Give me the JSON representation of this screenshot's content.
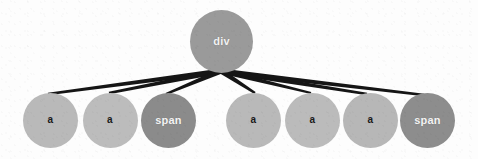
{
  "diagram": {
    "type": "tree",
    "background_color": "#fdfdfd",
    "edge_color": "#151515",
    "root": {
      "id": "root-div",
      "label": "div",
      "tag": "div",
      "cx": 221.5,
      "cy": 41,
      "r": 31.5,
      "fill": "#9a9a9a",
      "text_color": "#f2f2f2",
      "font_size": 11
    },
    "edge_origin": {
      "x": 221,
      "y": 71
    },
    "children": [
      {
        "id": "child-1",
        "label": "a",
        "tag": "a",
        "group": "left",
        "cx": 50.5,
        "cy": 120,
        "r": 27.5,
        "fill": "#b9b9b9",
        "text_color": "#1a1a1a",
        "endpoint": {
          "x": 48,
          "y": 94
        }
      },
      {
        "id": "child-2",
        "label": "a",
        "tag": "a",
        "group": "left",
        "cx": 110,
        "cy": 120,
        "r": 27.5,
        "fill": "#bcbcbc",
        "text_color": "#1a1a1a",
        "endpoint": {
          "x": 109,
          "y": 93
        }
      },
      {
        "id": "child-3",
        "label": "span",
        "tag": "span",
        "group": "left",
        "cx": 168.5,
        "cy": 120,
        "r": 27.5,
        "fill": "#8b8b8b",
        "text_color": "#f4f4f4",
        "endpoint": {
          "x": 166,
          "y": 94
        }
      },
      {
        "id": "child-4",
        "label": "a",
        "tag": "a",
        "group": "right",
        "cx": 253.5,
        "cy": 120,
        "r": 27.5,
        "fill": "#b9b9b9",
        "text_color": "#1a1a1a",
        "endpoint": {
          "x": 255,
          "y": 93
        }
      },
      {
        "id": "child-5",
        "label": "a",
        "tag": "a",
        "group": "right",
        "cx": 312.5,
        "cy": 120,
        "r": 27.5,
        "fill": "#bbbbbb",
        "text_color": "#1a1a1a",
        "endpoint": {
          "x": 311,
          "y": 93
        }
      },
      {
        "id": "child-6",
        "label": "a",
        "tag": "a",
        "group": "right",
        "cx": 370.5,
        "cy": 120,
        "r": 27.5,
        "fill": "#b7b7b7",
        "text_color": "#1a1a1a",
        "endpoint": {
          "x": 367,
          "y": 94
        }
      },
      {
        "id": "child-7",
        "label": "span",
        "tag": "span",
        "group": "right",
        "cx": 427.5,
        "cy": 120,
        "r": 27.5,
        "fill": "#8d8d8d",
        "text_color": "#f4f4f4",
        "endpoint": {
          "x": 424,
          "y": 95
        }
      }
    ]
  }
}
